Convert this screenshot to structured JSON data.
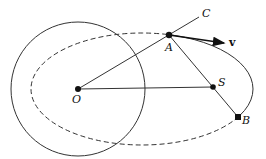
{
  "figure": {
    "labels": {
      "O": "O",
      "A": "A",
      "C": "C",
      "S": "S",
      "B": "B",
      "v": "v"
    },
    "colors": {
      "stroke": "#222222",
      "background": "#ffffff"
    }
  }
}
